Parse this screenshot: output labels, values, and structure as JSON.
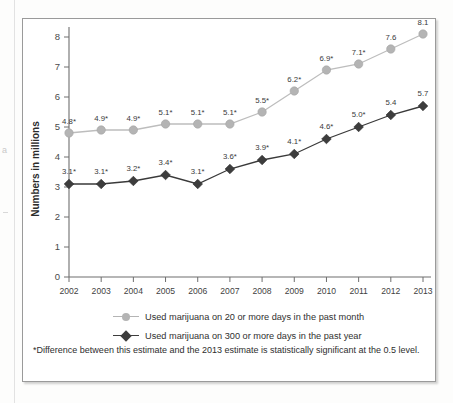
{
  "chart_data": {
    "type": "line",
    "title": "",
    "subtitle": "",
    "xlabel": "",
    "ylabel": "Numbers in millions",
    "categories": [
      "2002",
      "2003",
      "2004",
      "2005",
      "2006",
      "2007",
      "2008",
      "2009",
      "2010",
      "2011",
      "2012",
      "2013"
    ],
    "ylim": [
      0,
      8
    ],
    "yticks": [
      "0",
      "1",
      "2",
      "3",
      "4",
      "5",
      "6",
      "7",
      "8"
    ],
    "grid": false,
    "legend_position": "bottom",
    "series": [
      {
        "name": "Used marijuana on 20 or more days in the past month",
        "marker": "circle",
        "color": "#b4b4b4",
        "values": [
          4.8,
          4.9,
          4.9,
          5.1,
          5.1,
          5.1,
          5.5,
          6.2,
          6.9,
          7.1,
          7.6,
          8.1
        ],
        "point_labels": [
          "4.8*",
          "4.9*",
          "4.9*",
          "5.1*",
          "5.1*",
          "5.1*",
          "5.5*",
          "6.2*",
          "6.9*",
          "7.1*",
          "7.6",
          "8.1"
        ]
      },
      {
        "name": "Used marijuana on 300 or more days in the past year",
        "marker": "diamond",
        "color": "#3d3d3d",
        "values": [
          3.1,
          3.1,
          3.2,
          3.4,
          3.1,
          3.6,
          3.9,
          4.1,
          4.6,
          5.0,
          5.4,
          5.7
        ],
        "point_labels": [
          "3.1*",
          "3.1*",
          "3.2*",
          "3.4*",
          "3.1*",
          "3.6*",
          "3.9*",
          "4.1*",
          "4.6*",
          "5.0*",
          "5.4",
          "5.7"
        ]
      }
    ],
    "annotations": [
      "*Difference between this estimate and the 2013 estimate is statistically significant at the 0.5 level."
    ]
  },
  "footnote": {
    "text": "*Difference between this estimate and the 2013 estimate is statistically significant at the 0.5 level."
  },
  "margin_artifacts": {
    "letter": "a"
  }
}
